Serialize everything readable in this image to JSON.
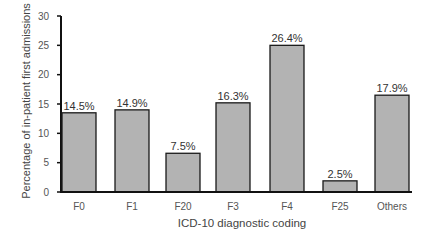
{
  "chart_data": {
    "type": "bar",
    "title": "",
    "xlabel": "ICD-10 diagnostic coding",
    "ylabel": "Percentage of in-patient first admissions",
    "categories": [
      "F0",
      "F1",
      "F20",
      "F3",
      "F4",
      "F25",
      "Others"
    ],
    "values": [
      14.5,
      14.9,
      7.5,
      16.3,
      26.4,
      2.5,
      17.9
    ],
    "value_labels": [
      "14.5%",
      "14.9%",
      "7.5%",
      "16.3%",
      "26.4%",
      "2.5%",
      "17.9%"
    ],
    "bar_heights_read_from_axis": [
      13.5,
      14.0,
      6.6,
      15.2,
      25.0,
      1.9,
      16.5
    ],
    "ylim": [
      0,
      30
    ],
    "yticks": [
      0,
      5,
      10,
      15,
      20,
      25,
      30
    ],
    "grid": false,
    "legend": null,
    "colors": {
      "bar_fill": "#b3b3b3",
      "bar_stroke": "#1a1a1a",
      "axis": "#111111"
    }
  }
}
